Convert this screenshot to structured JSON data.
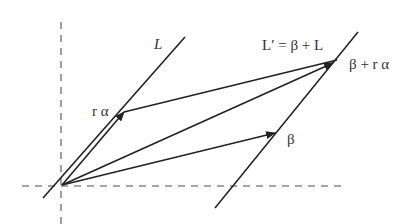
{
  "diagram": {
    "labels": {
      "L": "L",
      "L_prime": "L′ = β + L",
      "r_alpha": "r α",
      "beta": "β",
      "beta_plus_r_alpha": "β + r α"
    },
    "colors": {
      "line": "#222222",
      "axis": "#888888",
      "text": "#333333",
      "background": "#ffffff"
    },
    "axes": {
      "vertical": {
        "x": 61,
        "y1": 22,
        "y2": 224,
        "style": "dashed"
      },
      "horizontal": {
        "y": 186,
        "x1": 22,
        "x2": 345,
        "style": "dashed"
      }
    },
    "points": {
      "origin": [
        62,
        185
      ],
      "r_alpha": [
        124,
        112
      ],
      "beta": [
        275,
        133
      ],
      "beta_plus_r_alpha": [
        337,
        60
      ]
    },
    "lines": {
      "L": {
        "from": [
          43,
          198
        ],
        "to": [
          185,
          37
        ]
      },
      "L_prime": {
        "from": [
          215,
          208
        ],
        "to": [
          358,
          32
        ]
      }
    },
    "vectors": [
      {
        "name": "r-alpha-vector",
        "from": "origin",
        "to": "r_alpha",
        "arrow": true
      },
      {
        "name": "beta-vector",
        "from": "origin",
        "to": "beta",
        "arrow": true
      },
      {
        "name": "beta-plus-r-alpha-vector",
        "from": "origin",
        "to": "beta_plus_r_alpha",
        "arrow": true
      },
      {
        "name": "translation-vector",
        "from": "r_alpha",
        "to": "beta_plus_r_alpha",
        "arrow": true
      }
    ]
  }
}
